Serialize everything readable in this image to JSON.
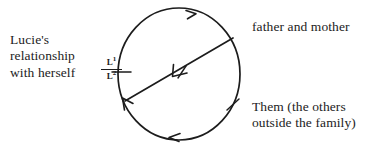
{
  "figure": {
    "type": "circle-diagram",
    "background_color": "#ffffff",
    "ink_color": "#1c1c1c",
    "circle": {
      "center_x": 179,
      "center_y": 74,
      "radius_x": 61,
      "radius_y": 66,
      "direction": "clockwise"
    }
  },
  "labels": {
    "left": "Lucie's\nrelationship\nwith herself",
    "top_right": "father and mother",
    "bottom_right": "Them (the others\noutside the family)"
  },
  "fraction": {
    "numerator": "L",
    "numerator_exponent": "1",
    "denominator": "L",
    "denominator_exponent": "2"
  },
  "marks": {
    "arrow_top_label": "clockwise-arrow-top",
    "arrow_bottom_label": "clockwise-arrow-bottom",
    "arrow_diagonal_label": "diagonal-arrow",
    "arrow_lower_left_label": "lower-left-arrow",
    "tick_left_label": "tick-left",
    "tick_right_label": "tick-right",
    "tick_diagonal_label": "tick-diagonal"
  }
}
